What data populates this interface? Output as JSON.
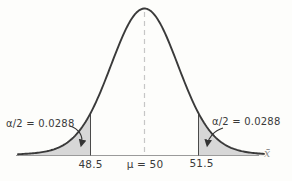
{
  "chart_data": {
    "type": "area",
    "distribution": "normal",
    "title": "",
    "mean": 50,
    "lower_critical_value": 48.5,
    "upper_critical_value": 51.5,
    "tail_area_each": 0.0288,
    "left_tail_label": "α/2 = 0.0288",
    "right_tail_label": "α/2 = 0.0288",
    "lower_critical_label": "48.5",
    "mean_label": "μ = 50",
    "upper_critical_label": "51.5",
    "x_axis_symbol": "x̄",
    "shaded_regions": [
      "x̄ ≤ 48.5",
      "x̄ ≥ 51.5"
    ],
    "legend": "none",
    "grid": "off"
  },
  "colors": {
    "background": "#fdfdfb",
    "curve": "#3a3a3a",
    "shade": "#d7d7d7",
    "shade_edge": "#9a9a9a",
    "cutoff_line": "#4a4a4a",
    "axis": "#9a9a9a",
    "dashed_mean_line": "#c6c6c6",
    "arrow": "#333333",
    "text": "#3a3a3a"
  }
}
